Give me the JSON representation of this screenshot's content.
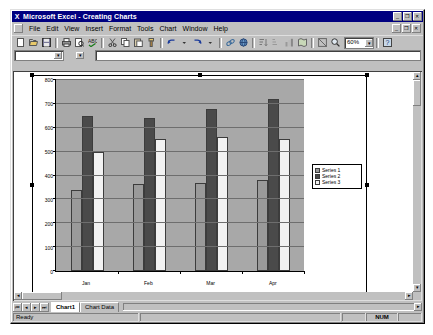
{
  "window": {
    "app_icon": "excel-x-icon",
    "title": "Microsoft Excel - Creating Charts",
    "app_buttons": [
      {
        "name": "minimize",
        "glyph": "_"
      },
      {
        "name": "restore",
        "glyph": "❐"
      },
      {
        "name": "close",
        "glyph": "✕"
      }
    ],
    "doc_buttons": [
      {
        "name": "minimize",
        "glyph": "_"
      },
      {
        "name": "restore",
        "glyph": "❐"
      },
      {
        "name": "close",
        "glyph": "✕"
      }
    ]
  },
  "menubar": {
    "items": [
      {
        "label": "File"
      },
      {
        "label": "Edit"
      },
      {
        "label": "View"
      },
      {
        "label": "Insert"
      },
      {
        "label": "Format"
      },
      {
        "label": "Tools"
      },
      {
        "label": "Chart"
      },
      {
        "label": "Window"
      },
      {
        "label": "Help"
      }
    ]
  },
  "toolbar": {
    "buttons": [
      {
        "name": "new-icon"
      },
      {
        "name": "open-icon"
      },
      {
        "name": "save-icon"
      },
      {
        "name": "print-icon"
      },
      {
        "name": "print-preview-icon"
      },
      {
        "name": "spelling-icon"
      },
      {
        "name": "cut-icon"
      },
      {
        "name": "copy-icon"
      },
      {
        "name": "paste-icon"
      },
      {
        "name": "format-painter-icon"
      },
      {
        "name": "undo-icon"
      },
      {
        "name": "redo-icon"
      },
      {
        "name": "insert-hyperlink-icon"
      },
      {
        "name": "web-toolbar-icon"
      },
      {
        "name": "sort-ascending-icon"
      },
      {
        "name": "sort-descending-icon"
      },
      {
        "name": "chart-wizard-icon"
      },
      {
        "name": "map-icon"
      },
      {
        "name": "drawing-icon"
      },
      {
        "name": "zoom-icon"
      },
      {
        "name": "office-assistant-icon"
      }
    ],
    "zoom_value": "60%",
    "zoom_arrow": "▾",
    "help_glyph": "?"
  },
  "formulabar": {
    "name_box_value": "",
    "name_box_arrow": "▾",
    "function_arrow": "▾",
    "formula_value": ""
  },
  "chart_data": {
    "type": "bar",
    "title": "",
    "xlabel": "",
    "ylabel": "",
    "categories": [
      "Jan",
      "Feb",
      "Mar",
      "Apr"
    ],
    "series": [
      {
        "name": "Series 1",
        "color": "#9a9a9a",
        "values": [
          340,
          365,
          370,
          380
        ]
      },
      {
        "name": "Series 2",
        "color": "#4a4a4a",
        "values": [
          650,
          640,
          680,
          720
        ]
      },
      {
        "name": "Series 3",
        "color": "#f2f2f2",
        "values": [
          500,
          555,
          560,
          555
        ]
      }
    ],
    "ylim": [
      0,
      800
    ],
    "yticks": [
      0,
      100,
      200,
      300,
      400,
      500,
      600,
      700,
      800
    ],
    "ytick_labels": [
      "0",
      "100",
      "200",
      "300",
      "400",
      "500",
      "600",
      "700",
      "800"
    ],
    "grid": true,
    "legend_position": "right",
    "plot_area_color": "#a8a8a8",
    "chart_area_color": "#ffffff"
  },
  "scrollbars": {
    "up_arrow": "▴",
    "down_arrow": "▾",
    "left_arrow": "◂",
    "right_arrow": "▸"
  },
  "sheettabs": {
    "nav_buttons": [
      "⏮",
      "◂",
      "▸",
      "⏭"
    ],
    "tabs": [
      {
        "label": "Chart1",
        "active": true
      },
      {
        "label": "Chart Data",
        "active": false
      }
    ]
  },
  "statusbar": {
    "message": "Ready",
    "indicators": [
      "NUM"
    ]
  }
}
